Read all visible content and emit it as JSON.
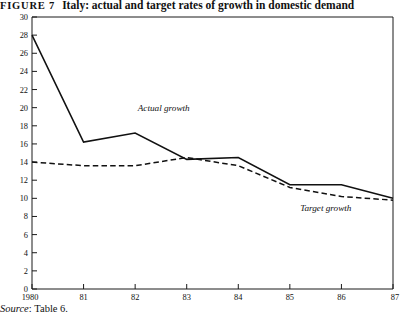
{
  "figure": {
    "number_label": "FIGURE 7",
    "caption": "Italy: actual and target rates of growth in domestic demand",
    "source_word": "Source",
    "source_separator": ":",
    "source_text": "Table 6."
  },
  "chart_data": {
    "type": "line",
    "title": "Italy: actual and target rates of growth in domestic demand",
    "xlabel": "",
    "ylabel": "",
    "grid": false,
    "legend": "inline-annotations",
    "categories": [
      "1980",
      "81",
      "82",
      "83",
      "84",
      "85",
      "86",
      "87"
    ],
    "x": [
      1980,
      1981,
      1982,
      1983,
      1984,
      1985,
      1986,
      1987
    ],
    "xlim": [
      1980,
      1987
    ],
    "ylim": [
      0,
      30
    ],
    "ytick_labels": [
      "0",
      "2",
      "4",
      "6",
      "8",
      "10",
      "12",
      "14",
      "16",
      "18",
      "20",
      "22",
      "24",
      "26",
      "28",
      "30"
    ],
    "yticks": [
      0,
      2,
      4,
      6,
      8,
      10,
      12,
      14,
      16,
      18,
      20,
      22,
      24,
      26,
      28,
      30
    ],
    "xtick_labels": [
      "1980",
      "81",
      "82",
      "83",
      "84",
      "85",
      "86",
      "87"
    ],
    "series": [
      {
        "name": "Actual growth",
        "style": "solid",
        "label_text": "Actual growth",
        "values": [
          28.0,
          16.2,
          17.2,
          14.3,
          14.5,
          11.5,
          11.5,
          10.0
        ]
      },
      {
        "name": "Target growth",
        "style": "dashed",
        "label_text": "Target growth",
        "values": [
          14.0,
          13.6,
          13.6,
          14.5,
          13.6,
          11.2,
          10.2,
          9.8
        ]
      }
    ],
    "annotations": [
      {
        "text": "Actual growth",
        "x": 1982.05,
        "y": 19.6
      },
      {
        "text": "Target growth",
        "x": 1985.2,
        "y": 8.6
      }
    ],
    "colors": {
      "axis": "#1a1a1a",
      "actual": "#111111",
      "target": "#111111",
      "background": "#ffffff"
    }
  }
}
